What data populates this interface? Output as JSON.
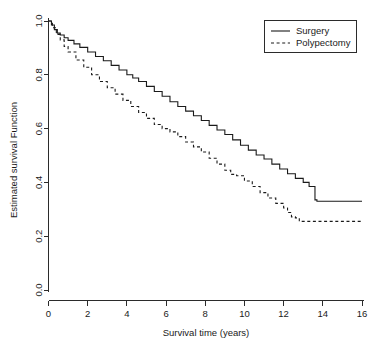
{
  "chart_data": {
    "type": "line",
    "title": "",
    "subtitle": "",
    "xlabel": "Survival time (years)",
    "ylabel": "Estimated survival Function",
    "xlim": [
      0,
      16
    ],
    "ylim": [
      0.0,
      1.0
    ],
    "xticks": [
      0,
      2,
      4,
      6,
      8,
      10,
      12,
      14,
      16
    ],
    "xtick_labels": [
      "0",
      "2",
      "4",
      "6",
      "8",
      "10",
      "12",
      "14",
      "16"
    ],
    "yticks": [
      0.0,
      0.2,
      0.4,
      0.6,
      0.8,
      1.0
    ],
    "ytick_labels": [
      "0.0",
      "0.2",
      "0.4",
      "0.6",
      "0.8",
      "1.0"
    ],
    "grid": false,
    "legend_position": "top-right",
    "axis_style": "L-shaped",
    "series": [
      {
        "name": "Surgery",
        "style": "solid",
        "color": "#1a1a1a",
        "x": [
          0.0,
          0.15,
          0.3,
          0.45,
          0.6,
          0.8,
          1.0,
          1.3,
          1.6,
          2.0,
          2.4,
          2.8,
          3.2,
          3.6,
          4.0,
          4.3,
          4.6,
          5.0,
          5.4,
          5.8,
          6.2,
          6.6,
          7.0,
          7.4,
          7.8,
          8.2,
          8.6,
          9.0,
          9.4,
          9.8,
          10.2,
          10.6,
          11.0,
          11.4,
          11.8,
          12.2,
          12.6,
          13.0,
          13.3,
          13.6,
          13.7,
          16.0
        ],
        "y": [
          1.0,
          0.985,
          0.968,
          0.955,
          0.948,
          0.938,
          0.928,
          0.915,
          0.902,
          0.885,
          0.868,
          0.852,
          0.835,
          0.818,
          0.8,
          0.788,
          0.775,
          0.757,
          0.738,
          0.72,
          0.7,
          0.682,
          0.665,
          0.648,
          0.63,
          0.612,
          0.595,
          0.578,
          0.558,
          0.538,
          0.52,
          0.502,
          0.487,
          0.468,
          0.45,
          0.432,
          0.415,
          0.4,
          0.385,
          0.335,
          0.33,
          0.33
        ]
      },
      {
        "name": "Polypectomy",
        "style": "dashed",
        "color": "#1a1a1a",
        "x": [
          0.0,
          0.2,
          0.4,
          0.6,
          0.8,
          1.0,
          1.4,
          1.8,
          2.2,
          2.6,
          3.0,
          3.4,
          3.8,
          4.2,
          4.6,
          5.0,
          5.4,
          5.8,
          6.2,
          6.6,
          7.0,
          7.4,
          7.8,
          8.2,
          8.6,
          9.0,
          9.3,
          9.6,
          10.0,
          10.4,
          10.8,
          11.2,
          11.6,
          12.0,
          12.2,
          12.4,
          12.6,
          12.8,
          16.0
        ],
        "y": [
          1.0,
          0.975,
          0.95,
          0.93,
          0.905,
          0.885,
          0.855,
          0.828,
          0.8,
          0.775,
          0.752,
          0.728,
          0.705,
          0.682,
          0.66,
          0.638,
          0.615,
          0.6,
          0.588,
          0.57,
          0.55,
          0.532,
          0.513,
          0.49,
          0.468,
          0.445,
          0.43,
          0.425,
          0.405,
          0.385,
          0.362,
          0.342,
          0.322,
          0.305,
          0.288,
          0.272,
          0.268,
          0.255,
          0.252
        ]
      }
    ]
  },
  "legend": {
    "entries": [
      {
        "label": "Surgery",
        "style": "solid"
      },
      {
        "label": "Polypectomy",
        "style": "dashed"
      }
    ]
  },
  "icons": {
    "legend_key_solid": "solid-line-icon",
    "legend_key_dashed": "dashed-line-icon"
  }
}
